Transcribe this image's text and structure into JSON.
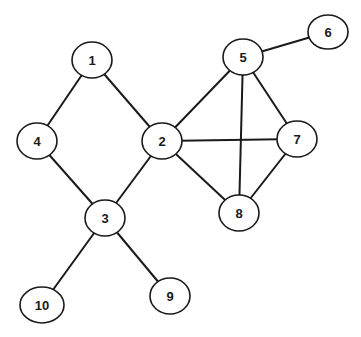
{
  "graph": {
    "nodes": [
      {
        "id": "1",
        "label": "1",
        "x": 92,
        "y": 60,
        "rx": 20,
        "ry": 18
      },
      {
        "id": "2",
        "label": "2",
        "x": 162,
        "y": 141,
        "rx": 20,
        "ry": 18
      },
      {
        "id": "3",
        "label": "3",
        "x": 105,
        "y": 218,
        "rx": 20,
        "ry": 18
      },
      {
        "id": "4",
        "label": "4",
        "x": 37,
        "y": 141,
        "rx": 20,
        "ry": 18
      },
      {
        "id": "5",
        "label": "5",
        "x": 243,
        "y": 57,
        "rx": 20,
        "ry": 18
      },
      {
        "id": "6",
        "label": "6",
        "x": 328,
        "y": 32,
        "rx": 20,
        "ry": 17
      },
      {
        "id": "7",
        "label": "7",
        "x": 297,
        "y": 139,
        "rx": 20,
        "ry": 18
      },
      {
        "id": "8",
        "label": "8",
        "x": 239,
        "y": 213,
        "rx": 20,
        "ry": 18
      },
      {
        "id": "9",
        "label": "9",
        "x": 170,
        "y": 296,
        "rx": 20,
        "ry": 18
      },
      {
        "id": "10",
        "label": "10",
        "x": 42,
        "y": 305,
        "rx": 22,
        "ry": 18
      }
    ],
    "edges": [
      [
        "1",
        "4"
      ],
      [
        "1",
        "2"
      ],
      [
        "4",
        "3"
      ],
      [
        "2",
        "3"
      ],
      [
        "2",
        "5"
      ],
      [
        "2",
        "7"
      ],
      [
        "2",
        "8"
      ],
      [
        "5",
        "6"
      ],
      [
        "5",
        "7"
      ],
      [
        "5",
        "8"
      ],
      [
        "7",
        "8"
      ],
      [
        "3",
        "10"
      ],
      [
        "3",
        "9"
      ]
    ]
  }
}
